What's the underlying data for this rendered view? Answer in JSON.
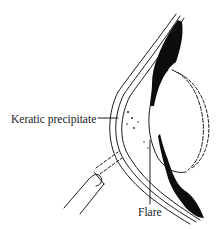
{
  "diagram": {
    "labels": [
      {
        "id": "kp",
        "text": "Keratic precipitate"
      },
      {
        "id": "flare",
        "text": "Flare"
      }
    ],
    "colors": {
      "line": "#1a1a1a",
      "fill_dark": "#0d0d0d",
      "background": "#ffffff"
    }
  }
}
